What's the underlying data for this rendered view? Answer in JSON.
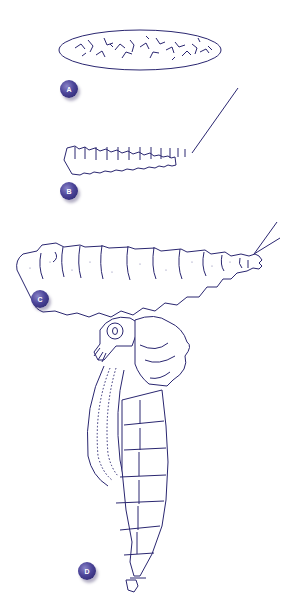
{
  "figure": {
    "stages": [
      {
        "label": "A",
        "name": "egg"
      },
      {
        "label": "B",
        "name": "young-larva"
      },
      {
        "label": "C",
        "name": "mature-larva"
      },
      {
        "label": "D",
        "name": "pupa"
      }
    ],
    "colors": {
      "ink": "#2a2670",
      "badge": "#4b4498",
      "background": "#ffffff"
    }
  }
}
